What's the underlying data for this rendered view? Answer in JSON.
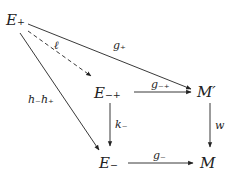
{
  "diagram": {
    "type": "commutative-diagram",
    "nodes": [
      {
        "id": "E_plus",
        "label": "E₊"
      },
      {
        "id": "E_minus_plus",
        "label": "E₋₊"
      },
      {
        "id": "M_prime",
        "label": "M′"
      },
      {
        "id": "E_minus",
        "label": "E₋"
      },
      {
        "id": "M",
        "label": "M"
      }
    ],
    "edges": [
      {
        "from": "E_plus",
        "to": "M_prime",
        "label": "g₊",
        "style": "solid"
      },
      {
        "from": "E_plus",
        "to": "E_minus_plus",
        "label": "ℓ",
        "style": "dashed"
      },
      {
        "from": "E_plus",
        "to": "E_minus",
        "label": "h₋h₊",
        "style": "solid"
      },
      {
        "from": "E_minus_plus",
        "to": "M_prime",
        "label": "g₋₊",
        "style": "solid"
      },
      {
        "from": "E_minus_plus",
        "to": "E_minus",
        "label": "k₋",
        "style": "solid"
      },
      {
        "from": "M_prime",
        "to": "M",
        "label": "w",
        "style": "solid"
      },
      {
        "from": "E_minus",
        "to": "M",
        "label": "g₋",
        "style": "solid"
      }
    ]
  }
}
